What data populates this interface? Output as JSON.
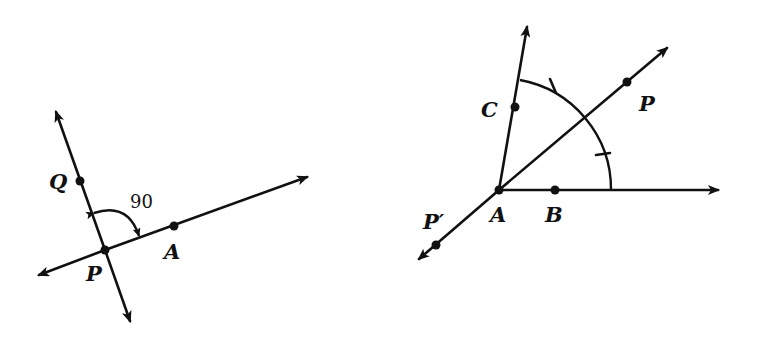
{
  "figure_left": {
    "labels": {
      "Q": "Q",
      "P": "P",
      "A": "A",
      "angle": "90"
    },
    "description": "Line PQ perpendicular to line through P and A, with a 90 degree angle arc between ray PQ and ray PA"
  },
  "figure_right": {
    "labels": {
      "A": "A",
      "B": "B",
      "C": "C",
      "P": "P",
      "P_prime": "P′"
    },
    "description": "Angle CAB with arc centered at A; ray AP bisects the arc with tick marks showing equal halves; line PP' passes through A"
  },
  "colors": {
    "stroke": "#111111",
    "background": "#ffffff"
  }
}
